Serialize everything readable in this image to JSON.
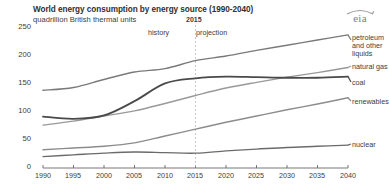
{
  "header": {
    "title": "World energy consumption by energy source (1990-2040)",
    "subtitle": "quadrillion British thermal units",
    "logo_text": "eia"
  },
  "annotations": {
    "divider_year": "2015",
    "history_label": "history",
    "projection_label": "projection"
  },
  "chart_data": {
    "type": "line",
    "title": "World energy consumption by energy source (1990-2040)",
    "subtitle": "quadrillion British thermal units",
    "xlabel": "",
    "ylabel": "quadrillion British thermal units",
    "xlim": [
      1990,
      2040
    ],
    "ylim": [
      0,
      250
    ],
    "yticks": [
      0,
      50,
      100,
      150,
      200,
      250
    ],
    "xticks": [
      1990,
      1995,
      2000,
      2005,
      2010,
      2015,
      2020,
      2025,
      2030,
      2035,
      2040
    ],
    "grid": false,
    "legend_position": "right",
    "divider_x": 2015,
    "x": [
      1990,
      1995,
      2000,
      2005,
      2010,
      2015,
      2020,
      2025,
      2030,
      2035,
      2040
    ],
    "series": [
      {
        "name": "petroleum and other liquids",
        "label": "petroleum\nand other\nliquids",
        "color": "#7a7a7a",
        "values": [
          136,
          141,
          155,
          168,
          174,
          188,
          196,
          206,
          215,
          224,
          233
        ]
      },
      {
        "name": "natural gas",
        "label": "natural gas",
        "color": "#999999",
        "values": [
          75,
          82,
          91,
          100,
          113,
          127,
          140,
          150,
          159,
          167,
          176
        ]
      },
      {
        "name": "coal",
        "label": "coal",
        "color": "#4a4a4a",
        "values": [
          90,
          86,
          92,
          117,
          148,
          157,
          160,
          159,
          158,
          158,
          160
        ]
      },
      {
        "name": "renewables",
        "label": "renewables",
        "color": "#8c8c8c",
        "values": [
          32,
          35,
          38,
          44,
          56,
          68,
          80,
          91,
          102,
          112,
          123
        ]
      },
      {
        "name": "nuclear",
        "label": "nuclear",
        "color": "#6b6b6b",
        "values": [
          20,
          23,
          26,
          28,
          27,
          26,
          30,
          33,
          36,
          38,
          40
        ]
      }
    ]
  },
  "axis": {
    "yticks": [
      "250",
      "200",
      "150",
      "100",
      "50",
      "0"
    ],
    "xticks": [
      "1990",
      "1995",
      "2000",
      "2005",
      "2010",
      "2015",
      "2020",
      "2025",
      "2030",
      "2035",
      "2040"
    ]
  },
  "legend": {
    "petroleum_line1": "petroleum",
    "petroleum_line2": "and other",
    "petroleum_line3": "liquids",
    "natural_gas": "natural gas",
    "coal": "coal",
    "renewables": "renewables",
    "nuclear": "nuclear"
  }
}
